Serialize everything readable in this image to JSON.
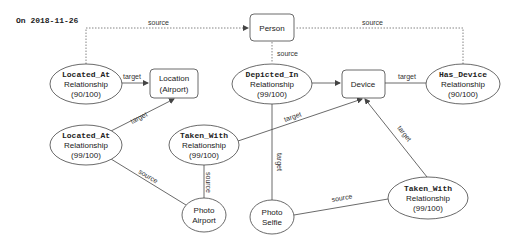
{
  "header": {
    "date_label": "On 2018-11-26"
  },
  "nodes": {
    "person": {
      "label": "Person"
    },
    "location": {
      "line1": "Location",
      "line2": "(Airport)"
    },
    "device": {
      "label": "Device"
    },
    "photo_airport": {
      "line1": "Photo",
      "line2": "Airport"
    },
    "photo_selfie": {
      "line1": "Photo",
      "line2": "Selfie"
    },
    "located_at_1": {
      "type": "Located_At",
      "kind": "Relationship",
      "score": "(90/100)"
    },
    "located_at_2": {
      "type": "Located_At",
      "kind": "Relationship",
      "score": "(99/100)"
    },
    "depicted_in": {
      "type": "Depicted_In",
      "kind": "Relationship",
      "score": "(99/100)"
    },
    "has_device": {
      "type": "Has_Device",
      "kind": "Relationship",
      "score": "(90/100)"
    },
    "taken_with_1": {
      "type": "Taken_With",
      "kind": "Relationship",
      "score": "(99/100)"
    },
    "taken_with_2": {
      "type": "Taken_With",
      "kind": "Relationship",
      "score": "(99/100)"
    }
  },
  "edges": {
    "source": "source",
    "target": "target"
  },
  "colors": {
    "stroke": "#444444",
    "text": "#222222",
    "background": "#ffffff"
  }
}
